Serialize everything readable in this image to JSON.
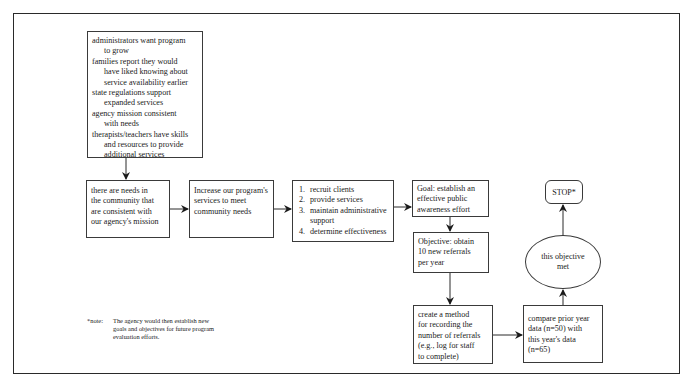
{
  "diagram": {
    "nodes": {
      "rationale": {
        "items": [
          {
            "first": "administrators want program",
            "rest": [
              "to grow"
            ]
          },
          {
            "first": "families report they would",
            "rest": [
              "have liked knowing about",
              "service availability earlier"
            ]
          },
          {
            "first": "state regulations support",
            "rest": [
              "expanded services"
            ]
          },
          {
            "first": "agency mission consistent",
            "rest": [
              "with needs"
            ]
          },
          {
            "first": "therapists/teachers have skills",
            "rest": [
              "and resources to provide",
              "additional services"
            ]
          }
        ]
      },
      "needs": {
        "lines": [
          "there are needs in",
          "the community that",
          "are consistent with",
          "our agency's mission"
        ]
      },
      "increase": {
        "lines": [
          "Increase our program's",
          "services to meet",
          "community needs"
        ]
      },
      "steps": {
        "items": [
          {
            "num": "1.",
            "text": "recruit clients",
            "cont": ""
          },
          {
            "num": "2.",
            "text": "provide services",
            "cont": ""
          },
          {
            "num": "3.",
            "text": "maintain administrative",
            "cont": "support"
          },
          {
            "num": "4.",
            "text": "determine effectiveness",
            "cont": ""
          }
        ]
      },
      "goal": {
        "lines": [
          "Goal: establish an",
          "effective public",
          "awareness effort"
        ]
      },
      "objective": {
        "lines": [
          "Objective: obtain",
          "10 new referrals",
          "per year"
        ]
      },
      "method": {
        "lines": [
          "create a method",
          "for recording the",
          "number of referrals",
          "(e.g., log for staff",
          "to complete)"
        ]
      },
      "compare": {
        "lines": [
          "compare prior year",
          "data (n=50) with",
          "this year's data",
          "(n=65)"
        ]
      },
      "decision": {
        "lines": [
          "this objective",
          "met"
        ]
      },
      "stop": {
        "label": "STOP*"
      }
    },
    "note": {
      "label": "*note:",
      "lines": [
        "The agency would then establish new",
        "goals and objectives for future program",
        "evaluation efforts."
      ]
    },
    "edges": [
      {
        "from": "rationale",
        "to": "needs"
      },
      {
        "from": "needs",
        "to": "increase"
      },
      {
        "from": "increase",
        "to": "steps"
      },
      {
        "from": "steps",
        "to": "goal"
      },
      {
        "from": "goal",
        "to": "objective"
      },
      {
        "from": "objective",
        "to": "method"
      },
      {
        "from": "method",
        "to": "compare"
      },
      {
        "from": "compare",
        "to": "decision"
      },
      {
        "from": "decision",
        "to": "stop"
      }
    ],
    "colors": {
      "line": "#2a2a2a",
      "background": "#ffffff",
      "text": "#1a1a1a"
    }
  }
}
